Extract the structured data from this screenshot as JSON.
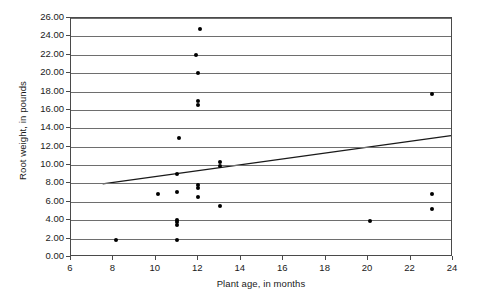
{
  "chart_data": {
    "type": "scatter",
    "title": "",
    "xlabel": "Plant age, in months",
    "ylabel": "Root weight, in pounds",
    "xlim": [
      6,
      24
    ],
    "ylim": [
      0,
      26
    ],
    "xticks": [
      "6",
      "8",
      "10",
      "12",
      "14",
      "16",
      "18",
      "20",
      "22",
      "24"
    ],
    "xtick_values": [
      6,
      8,
      10,
      12,
      14,
      16,
      18,
      20,
      22,
      24
    ],
    "yticks": [
      "0.00",
      "2.00",
      "4.00",
      "6.00",
      "8.00",
      "10.00",
      "12.00",
      "14.00",
      "16.00",
      "18.00",
      "20.00",
      "22.00",
      "24.00",
      "26.00"
    ],
    "ytick_values": [
      0,
      2,
      4,
      6,
      8,
      10,
      12,
      14,
      16,
      18,
      20,
      22,
      24,
      26
    ],
    "grid": "horizontal",
    "legend": "none",
    "series": [
      {
        "name": "Plant observations",
        "marker": "filled-circle",
        "color": "#000000",
        "points": [
          [
            8.1,
            1.8
          ],
          [
            10.1,
            6.9
          ],
          [
            11.0,
            1.8
          ],
          [
            11.0,
            3.5
          ],
          [
            11.0,
            3.8
          ],
          [
            11.0,
            4.0
          ],
          [
            11.0,
            7.1
          ],
          [
            11.0,
            9.0
          ],
          [
            11.1,
            13.0
          ],
          [
            11.9,
            22.0
          ],
          [
            12.0,
            6.5
          ],
          [
            12.0,
            7.5
          ],
          [
            12.0,
            7.8
          ],
          [
            12.0,
            16.5
          ],
          [
            12.0,
            17.0
          ],
          [
            12.0,
            20.0
          ],
          [
            12.1,
            24.8
          ],
          [
            13.0,
            5.6
          ],
          [
            13.0,
            9.9
          ],
          [
            13.0,
            10.3
          ],
          [
            20.1,
            3.9
          ],
          [
            23.0,
            5.2
          ],
          [
            23.0,
            6.9
          ],
          [
            23.0,
            17.7
          ]
        ]
      }
    ],
    "trendline": {
      "name": "Linear trend",
      "color": "#1a1a1a",
      "x_start": 7.5,
      "y_start": 7.8,
      "x_end": 24.0,
      "y_end": 13.1
    }
  }
}
